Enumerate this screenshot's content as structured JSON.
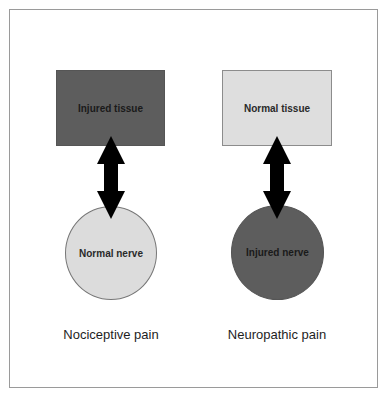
{
  "diagram": {
    "left": {
      "tissue_label": "Injured tissue",
      "tissue_state": "injured",
      "nerve_label": "Normal nerve",
      "nerve_state": "normal",
      "caption": "Nociceptive pain"
    },
    "right": {
      "tissue_label": "Normal tissue",
      "tissue_state": "normal",
      "nerve_label": "Injured nerve",
      "nerve_state": "injured",
      "caption": "Neuropathic pain"
    },
    "colors": {
      "injured_fill": "#5d5d5d",
      "normal_fill": "#dedede",
      "arrow": "#000000",
      "frame_border": "#9a9a9a"
    },
    "connector": "double-headed-arrow"
  }
}
